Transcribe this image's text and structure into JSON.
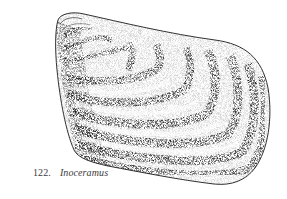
{
  "figure": {
    "number": "122.",
    "title": "Inoceramus",
    "illustration": "stippled-bivalve-shell",
    "ink_color": "#1a1a1a",
    "background": "#ffffff",
    "growth_rings": 9
  }
}
